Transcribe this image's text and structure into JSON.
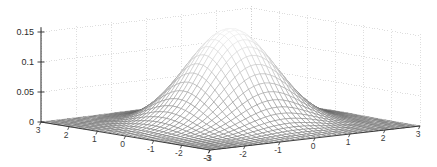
{
  "figure": {
    "title": "",
    "background_color": "#ffffff",
    "axis_color": "#2b2b2b",
    "grid_color": "#c8c8c8",
    "mesh_dark_color": "#4a4a4a",
    "mesh_light_color": "#e8e8e8",
    "width": 437,
    "height": 167
  },
  "chart_data": {
    "type": "line",
    "plot_kind": "surface-mesh-3d",
    "title": "",
    "subtitle": "",
    "xlabel": "",
    "ylabel": "",
    "zlabel": "",
    "legend": [],
    "legend_position": "none",
    "grid": true,
    "grid_style": "dotted",
    "projection": "3d-isometric",
    "function": "bivariate gaussian: z = (1/(2*pi)) * exp(-(x^2 + y^2)/2)",
    "xlim": [
      -3,
      3
    ],
    "ylim": [
      -3,
      3
    ],
    "zlim": [
      0,
      0.16
    ],
    "x_tick_labels": [
      "3",
      "2",
      "1",
      "0",
      "-1",
      "-2",
      "-3"
    ],
    "x_tick_values": [
      3,
      2,
      1,
      0,
      -1,
      -2,
      -3
    ],
    "y_tick_labels": [
      "-3",
      "-2",
      "-1",
      "0",
      "1",
      "2",
      "3"
    ],
    "y_tick_values": [
      -3,
      -2,
      -1,
      0,
      1,
      2,
      3
    ],
    "z_tick_labels": [
      "0",
      "0.05",
      "0.1",
      "0.15"
    ],
    "z_tick_values": [
      0,
      0.05,
      0.1,
      0.15
    ],
    "peak_value": 0.159,
    "peak_x": 0,
    "peak_y": 0,
    "mesh_resolution_x": 41,
    "mesh_resolution_y": 41,
    "series": [
      {
        "name": "gaussian-surface",
        "x": [
          -3,
          -2.5,
          -2,
          -1.5,
          -1,
          -0.5,
          0,
          0.5,
          1,
          1.5,
          2,
          2.5,
          3
        ],
        "y": [
          -3,
          -2.5,
          -2,
          -1.5,
          -1,
          -0.5,
          0,
          0.5,
          1,
          1.5,
          2,
          2.5,
          3
        ],
        "z_rows": [
          [
            0.0002,
            0.0004,
            0.0011,
            0.0023,
            0.0038,
            0.005,
            0.0054,
            0.005,
            0.0038,
            0.0023,
            0.0011,
            0.0004,
            0.0002
          ],
          [
            0.0004,
            0.0014,
            0.0038,
            0.0079,
            0.0131,
            0.0172,
            0.0186,
            0.0172,
            0.0131,
            0.0079,
            0.0038,
            0.0014,
            0.0004
          ],
          [
            0.0011,
            0.0038,
            0.0103,
            0.0216,
            0.0357,
            0.0468,
            0.0508,
            0.0468,
            0.0357,
            0.0216,
            0.0103,
            0.0038,
            0.0011
          ],
          [
            0.0023,
            0.0079,
            0.0216,
            0.0453,
            0.075,
            0.0983,
            0.1065,
            0.0983,
            0.075,
            0.0453,
            0.0216,
            0.0079,
            0.0023
          ],
          [
            0.0038,
            0.0131,
            0.0357,
            0.075,
            0.1239,
            0.1624,
            0.176,
            0.1624,
            0.1239,
            0.075,
            0.0357,
            0.0131,
            0.0038
          ],
          [
            0.005,
            0.0172,
            0.0468,
            0.0983,
            0.1624,
            0.2129,
            0.2307,
            0.2129,
            0.1624,
            0.0983,
            0.0468,
            0.0172,
            0.005
          ],
          [
            0.0054,
            0.0186,
            0.0508,
            0.1065,
            0.176,
            0.2307,
            0.25,
            0.2307,
            0.176,
            0.1065,
            0.0508,
            0.0186,
            0.0054
          ],
          [
            0.005,
            0.0172,
            0.0468,
            0.0983,
            0.1624,
            0.2129,
            0.2307,
            0.2129,
            0.1624,
            0.0983,
            0.0468,
            0.0172,
            0.005
          ],
          [
            0.0038,
            0.0131,
            0.0357,
            0.075,
            0.1239,
            0.1624,
            0.176,
            0.1624,
            0.1239,
            0.075,
            0.0357,
            0.0131,
            0.0038
          ],
          [
            0.0023,
            0.0079,
            0.0216,
            0.0453,
            0.075,
            0.0983,
            0.1065,
            0.0983,
            0.075,
            0.0453,
            0.0216,
            0.0079,
            0.0023
          ],
          [
            0.0011,
            0.0038,
            0.0103,
            0.0216,
            0.0357,
            0.0468,
            0.0508,
            0.0468,
            0.0357,
            0.0216,
            0.0103,
            0.0038,
            0.0011
          ],
          [
            0.0004,
            0.0014,
            0.0038,
            0.0079,
            0.0131,
            0.0172,
            0.0186,
            0.0172,
            0.0131,
            0.0079,
            0.0038,
            0.0014,
            0.0004
          ],
          [
            0.0002,
            0.0004,
            0.0011,
            0.0023,
            0.0038,
            0.005,
            0.0054,
            0.005,
            0.0038,
            0.0023,
            0.0011,
            0.0004,
            0.0002
          ]
        ]
      }
    ]
  },
  "axes": {
    "z_ticks": [
      {
        "label": "0.15",
        "value": 0.15
      },
      {
        "label": "0.1",
        "value": 0.1
      },
      {
        "label": "0.05",
        "value": 0.05
      },
      {
        "label": "0",
        "value": 0
      }
    ],
    "x_ticks": [
      {
        "label": "3",
        "value": 3
      },
      {
        "label": "2",
        "value": 2
      },
      {
        "label": "1",
        "value": 1
      },
      {
        "label": "0",
        "value": 0
      },
      {
        "label": "-1",
        "value": -1
      },
      {
        "label": "-2",
        "value": -2
      },
      {
        "label": "-3",
        "value": -3
      }
    ],
    "y_ticks": [
      {
        "label": "-3",
        "value": -3
      },
      {
        "label": "-2",
        "value": -2
      },
      {
        "label": "-1",
        "value": -1
      },
      {
        "label": "0",
        "value": 0
      },
      {
        "label": "1",
        "value": 1
      },
      {
        "label": "2",
        "value": 2
      },
      {
        "label": "3",
        "value": 3
      }
    ]
  }
}
